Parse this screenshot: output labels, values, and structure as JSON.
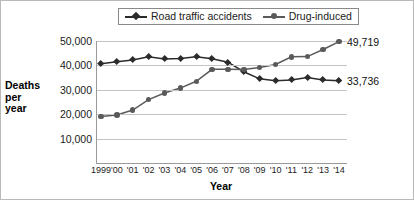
{
  "chart_data": {
    "type": "line",
    "title": "",
    "xlabel": "Year",
    "ylabel": "Deaths per year",
    "ylabel_lines": [
      "Deaths",
      "per",
      "year"
    ],
    "categories": [
      "1999",
      "'00",
      "'01",
      "'02",
      "'03",
      "'04",
      "'05",
      "'06",
      "'07",
      "'08",
      "'09",
      "'10",
      "'11",
      "'12",
      "'13",
      "'14"
    ],
    "x_full_years": [
      1999,
      2000,
      2001,
      2002,
      2003,
      2004,
      2005,
      2006,
      2007,
      2008,
      2009,
      2010,
      2011,
      2012,
      2013,
      2014
    ],
    "ylim": [
      0,
      50000
    ],
    "yticks": [
      10000,
      20000,
      30000,
      40000,
      50000
    ],
    "ytick_labels": [
      "10,000",
      "20,000",
      "30,000",
      "40,000",
      "50,000"
    ],
    "grid": true,
    "grid_axis": "y",
    "legend_position": "top-center",
    "series": [
      {
        "name": "Road traffic accidents",
        "marker": "diamond",
        "color": "#2b2b2b",
        "values": [
          40700,
          41500,
          42200,
          43500,
          42600,
          42800,
          43500,
          42700,
          41300,
          37400,
          34500,
          33700,
          34000,
          35000,
          34000,
          33736
        ],
        "end_label": "33,736"
      },
      {
        "name": "Drug-induced",
        "marker": "circle",
        "color": "#5a5a5a",
        "values": [
          19100,
          19700,
          21700,
          26000,
          28700,
          30700,
          33500,
          38400,
          38400,
          38300,
          39100,
          40400,
          43500,
          43600,
          46500,
          49719
        ],
        "end_label": "49,719"
      }
    ]
  },
  "legend": {
    "entries": [
      {
        "label": "Road traffic accidents",
        "marker": "diamond-marker",
        "color": "#2b2b2b"
      },
      {
        "label": "Drug-induced",
        "marker": "circle-marker",
        "color": "#5a5a5a"
      }
    ]
  },
  "colors": {
    "background": "#ffffff",
    "axis": "#9a9a9a",
    "gridline": "#c4c4c4",
    "text": "#1b1b1b",
    "series_road": "#2b2b2b",
    "series_drug": "#5a5a5a"
  }
}
